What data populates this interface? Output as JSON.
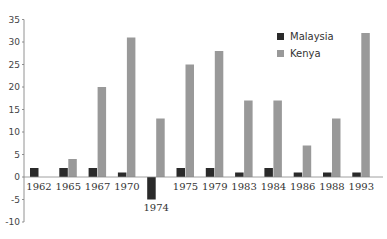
{
  "chart_data": {
    "type": "bar",
    "title": "",
    "xlabel": "",
    "ylabel": "",
    "ylim": [
      -10,
      35
    ],
    "yticks": [
      35,
      30,
      25,
      20,
      15,
      10,
      5,
      0,
      -5,
      -10
    ],
    "grid": false,
    "legend_position": "upper right",
    "categories": [
      "1962",
      "1965",
      "1967",
      "1970",
      "1974",
      "1975",
      "1979",
      "1983",
      "1984",
      "1986",
      "1988",
      "1993"
    ],
    "series": [
      {
        "name": "Malaysia",
        "color": "#2a2a2a",
        "values": [
          2,
          2,
          2,
          1,
          -5,
          2,
          2,
          1,
          2,
          1,
          1,
          1
        ]
      },
      {
        "name": "Kenya",
        "color": "#999999",
        "values": [
          0,
          4,
          20,
          31,
          13,
          25,
          28,
          17,
          17,
          7,
          13,
          32
        ]
      }
    ]
  },
  "legend": {
    "items": [
      {
        "label": "Malaysia",
        "color": "#2a2a2a"
      },
      {
        "label": "Kenya",
        "color": "#999999"
      }
    ]
  }
}
